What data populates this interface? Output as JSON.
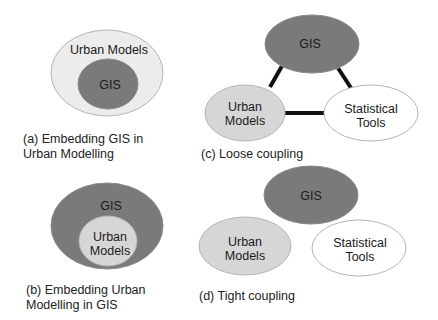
{
  "colors": {
    "dark_fill": "#7a7a7a",
    "light_fill": "#d6d6d6",
    "lighter_fill": "#ececec",
    "white_fill": "#ffffff",
    "stroke": "#b0b0b0",
    "link": "#111111"
  },
  "panels": {
    "a": {
      "caption_line1": "(a) Embedding GIS in",
      "caption_line2": "Urban Modelling",
      "outer_label": "Urban Models",
      "inner_label": "GIS"
    },
    "b": {
      "caption_line1": "(b) Embedding Urban",
      "caption_line2": "Modelling in GIS",
      "outer_label": "GIS",
      "inner_label_line1": "Urban",
      "inner_label_line2": "Models"
    },
    "c": {
      "caption": "(c) Loose coupling",
      "gis_label": "GIS",
      "urban_label_line1": "Urban",
      "urban_label_line2": "Models",
      "stat_label_line1": "Statistical",
      "stat_label_line2": "Tools"
    },
    "d": {
      "caption": "(d) Tight coupling",
      "gis_label": "GIS",
      "urban_label_line1": "Urban",
      "urban_label_line2": "Models",
      "stat_label_line1": "Statistical",
      "stat_label_line2": "Tools"
    }
  }
}
